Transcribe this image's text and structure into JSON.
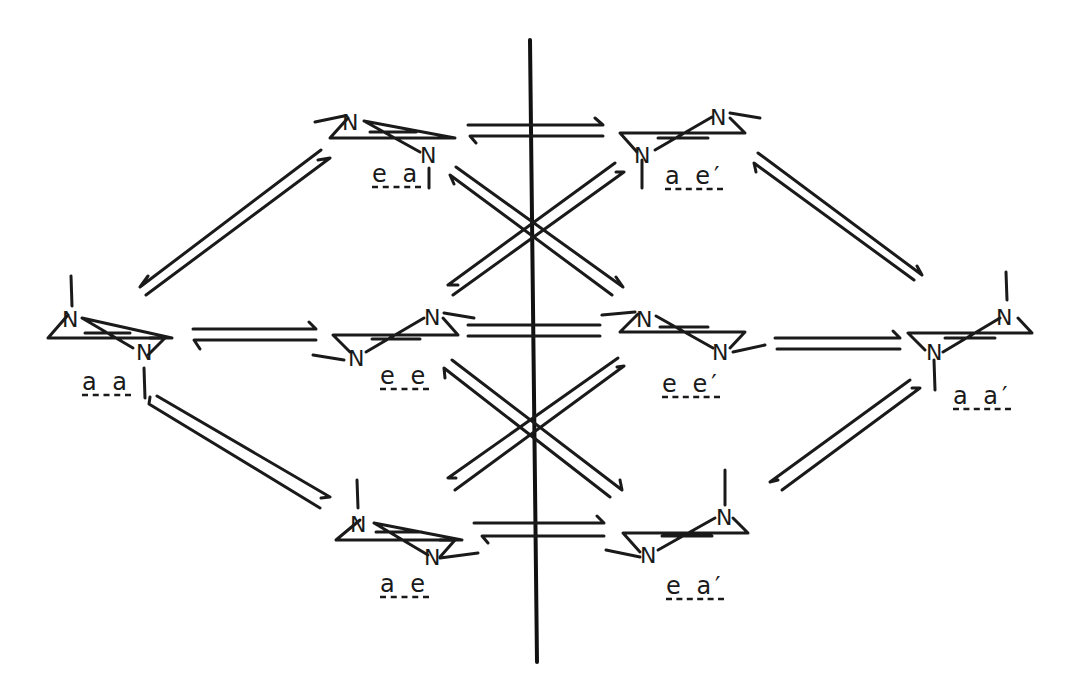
{
  "diagram": {
    "type": "conformational-equilibrium-network",
    "mirror_plane": "vertical line at center",
    "nodes": [
      {
        "id": "aa",
        "label": "a a",
        "position": "left-middle"
      },
      {
        "id": "ea",
        "label": "e a",
        "position": "top-left-inner"
      },
      {
        "id": "ee",
        "label": "e e",
        "position": "middle-left-inner"
      },
      {
        "id": "ae",
        "label": "a e",
        "position": "bottom-left-inner"
      },
      {
        "id": "ae_p",
        "label": "a e′",
        "position": "top-right-inner"
      },
      {
        "id": "ee_p",
        "label": "e e′",
        "position": "middle-right-inner"
      },
      {
        "id": "ea_p",
        "label": "e a′",
        "position": "bottom-right-inner"
      },
      {
        "id": "aa_p",
        "label": "a a′",
        "position": "right-middle"
      }
    ],
    "atom_label": "N",
    "equilibria": [
      [
        "aa",
        "ea"
      ],
      [
        "aa",
        "ee"
      ],
      [
        "aa",
        "ae"
      ],
      [
        "ea",
        "ae_p"
      ],
      [
        "ee",
        "ee_p"
      ],
      [
        "ae",
        "ea_p"
      ],
      [
        "ea",
        "ee_p"
      ],
      [
        "ee",
        "ae_p"
      ],
      [
        "ee",
        "ea_p"
      ],
      [
        "ae",
        "ee_p"
      ],
      [
        "ae_p",
        "aa_p"
      ],
      [
        "ee_p",
        "aa_p"
      ],
      [
        "ea_p",
        "aa_p"
      ]
    ]
  }
}
